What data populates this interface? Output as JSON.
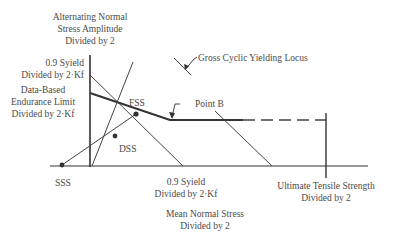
{
  "diagram": {
    "y_axis_title": [
      "Alternating Normal",
      "Stress Amplitude",
      "Divided by 2"
    ],
    "x_axis_title": [
      "Mean Normal Stress",
      "Divided by 2"
    ],
    "y_labels": {
      "yield": [
        "0.9 Syield",
        "Divided by 2·Kf"
      ],
      "endurance": [
        "Data-Based",
        "Endurance Limit",
        "Divided by 2·Kf"
      ]
    },
    "x_labels": {
      "yield": [
        "0.9 Syield",
        "Divided by 2·Kf"
      ],
      "uts": [
        "Ultimate Tensile Strength",
        "Divided by 2"
      ]
    },
    "annotations": {
      "gross_cyclic": "Gross Cyclic Yielding Locus",
      "point_b": "Point B",
      "fss": "FSS",
      "dss": "DSS",
      "sss": "SSS"
    },
    "colors": {
      "ink": "#3a3a3a",
      "text": "#4a4a4a",
      "background": "#ffffff"
    }
  }
}
